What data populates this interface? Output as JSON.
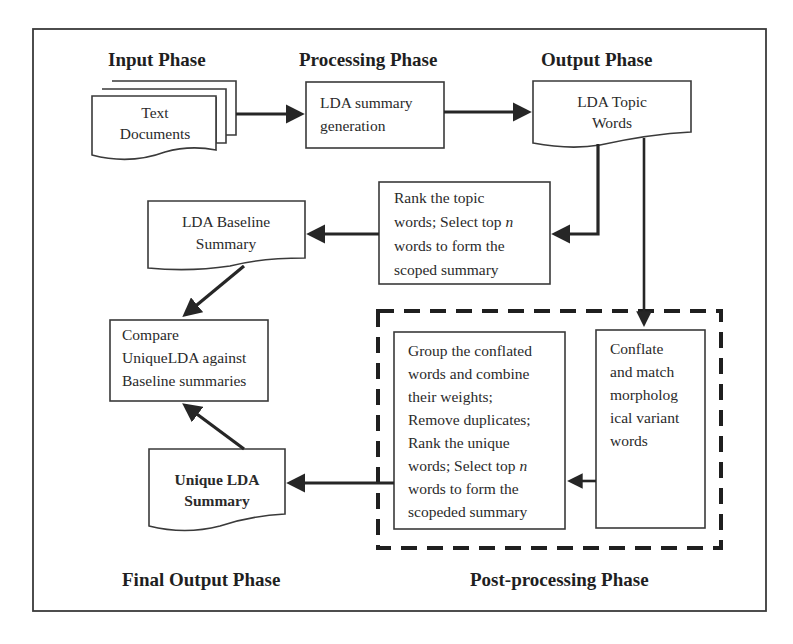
{
  "phases": {
    "input": "Input Phase",
    "processing": "Processing Phase",
    "output": "Output Phase",
    "final_output": "Final Output Phase",
    "post_processing": "Post-processing Phase"
  },
  "nodes": {
    "text_documents": {
      "lines": [
        "Text",
        "Documents"
      ],
      "shape": "multi-document"
    },
    "lda_summary_generation": {
      "lines": [
        "LDA summary",
        "generation"
      ],
      "shape": "process"
    },
    "lda_topic_words": {
      "lines": [
        "LDA Topic",
        "Words"
      ],
      "shape": "document"
    },
    "rank_topic_words": {
      "lines": [
        "Rank the topic",
        "words; Select top ",
        "n",
        "words to form the",
        "scoped summary"
      ],
      "shape": "process"
    },
    "lda_baseline_summary": {
      "lines": [
        "LDA Baseline",
        "Summary"
      ],
      "shape": "document"
    },
    "compare": {
      "lines": [
        "Compare",
        "UniqueLDA against",
        "Baseline summaries"
      ],
      "shape": "process"
    },
    "unique_lda_summary": {
      "lines": [
        "Unique LDA",
        "Summary"
      ],
      "shape": "document"
    },
    "group_conflated": {
      "lines": [
        "Group the conflated",
        "words and combine",
        "their weights;",
        "Remove duplicates;",
        "Rank the unique",
        "words; Select top ",
        "n",
        "words to form the",
        "scopeded summary"
      ],
      "shape": "process"
    },
    "conflate_match": {
      "lines": [
        "Conflate",
        "and match",
        "morpholog",
        "ical variant",
        "words"
      ],
      "shape": "process"
    }
  },
  "edges": [
    {
      "from": "text_documents",
      "to": "lda_summary_generation"
    },
    {
      "from": "lda_summary_generation",
      "to": "lda_topic_words"
    },
    {
      "from": "lda_topic_words",
      "to": "rank_topic_words"
    },
    {
      "from": "lda_topic_words",
      "to": "conflate_match"
    },
    {
      "from": "rank_topic_words",
      "to": "lda_baseline_summary"
    },
    {
      "from": "lda_baseline_summary",
      "to": "compare"
    },
    {
      "from": "conflate_match",
      "to": "group_conflated"
    },
    {
      "from": "group_conflated",
      "to": "unique_lda_summary"
    },
    {
      "from": "unique_lda_summary",
      "to": "compare"
    }
  ],
  "colors": {
    "stroke": "#3a3a3a",
    "arrow": "#262626",
    "background": "#ffffff"
  }
}
